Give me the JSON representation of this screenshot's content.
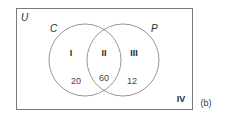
{
  "diagram": {
    "type": "venn",
    "universe_label": "U",
    "sets": [
      {
        "label": "C"
      },
      {
        "label": "P"
      }
    ],
    "regions": [
      {
        "id": "I",
        "label": "I",
        "description": "C only",
        "value": "20"
      },
      {
        "id": "II",
        "label": "II",
        "description": "C and P",
        "value": "60"
      },
      {
        "id": "III",
        "label": "III",
        "description": "P only",
        "value": "12"
      },
      {
        "id": "IV",
        "label": "IV",
        "description": "neither C nor P",
        "value": ""
      }
    ],
    "caption": "(b)"
  },
  "colors": {
    "stroke": "#7a7a7a",
    "text": "#2b2b2b",
    "background": "#ffffff"
  }
}
